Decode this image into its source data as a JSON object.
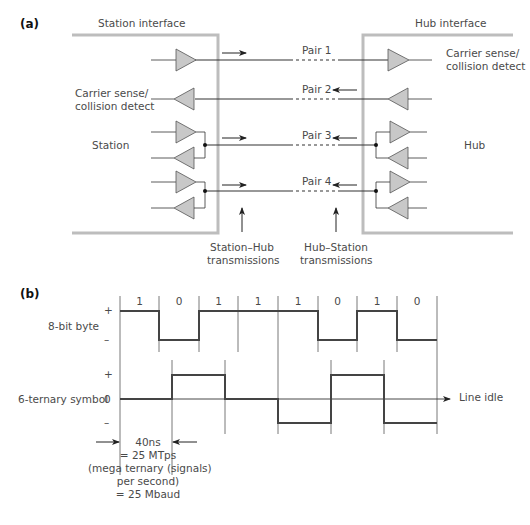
{
  "part_a": {
    "label": "(a)",
    "station_interface_label": "Station interface",
    "hub_interface_label": "Hub interface",
    "station_label": "Station",
    "hub_label": "Hub",
    "station_carrier_sense_line1": "Carrier sense/",
    "station_carrier_sense_line2": "collision detect",
    "hub_carrier_sense_line1": "Carrier sense/",
    "hub_carrier_sense_line2": "collision detect",
    "pairs": [
      {
        "label": "Pair 1",
        "direction": "station-to-hub"
      },
      {
        "label": "Pair 2",
        "direction": "hub-to-station"
      },
      {
        "label": "Pair 3",
        "direction": "bidirectional"
      },
      {
        "label": "Pair 4",
        "direction": "bidirectional"
      }
    ],
    "station_hub_label_line1": "Station–Hub",
    "station_hub_label_line2": "transmissions",
    "hub_station_label_line1": "Hub–Station",
    "hub_station_label_line2": "transmissions",
    "colors": {
      "interface_border": "#bdbdbd",
      "driver_fill": "#c8c8c8",
      "line": "#333333"
    }
  },
  "part_b": {
    "label": "(b)",
    "byte_label": "8-bit byte",
    "byte_plus": "+",
    "byte_minus": "–",
    "bits": [
      "1",
      "0",
      "1",
      "1",
      "1",
      "0",
      "1",
      "0"
    ],
    "ternary_label": "6-ternary symbol",
    "ternary_plus": "+",
    "ternary_zero": "0",
    "ternary_minus": "–",
    "ternary_symbols": [
      "0",
      "+",
      "0",
      "–",
      "+",
      "–"
    ],
    "line_idle_label": "Line idle",
    "timing_line1": "40ns",
    "timing_line2": "= 25 MTps",
    "timing_line3": "(mega ternary (signals)",
    "timing_line4": "per second)",
    "timing_line5": "= 25 Mbaud"
  }
}
